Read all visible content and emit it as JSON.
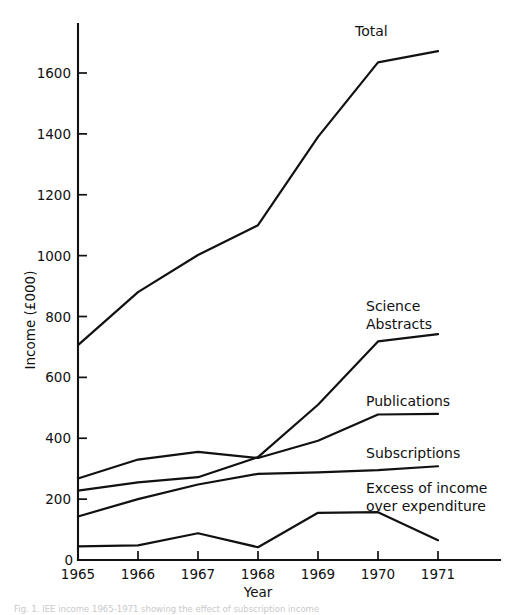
{
  "figure": {
    "caption": "Fig. 1. IEE income 1965-1971 showing the effect of subscription income"
  },
  "chart_data": {
    "type": "line",
    "title": "",
    "xlabel": "Year",
    "ylabel": "Income (£000)",
    "categories": [
      "1965",
      "1966",
      "1967",
      "1968",
      "1969",
      "1970",
      "1971"
    ],
    "x": [
      1965,
      1966,
      1967,
      1968,
      1969,
      1970,
      1971
    ],
    "xlim": [
      1965,
      1971
    ],
    "ylim": [
      0,
      1750
    ],
    "yticks": [
      0,
      200,
      400,
      600,
      800,
      1000,
      1200,
      1400,
      1600
    ],
    "ytick_labels": [
      "0",
      "200",
      "400",
      "600",
      "800",
      "1000",
      "1200",
      "1400",
      "1600"
    ],
    "grid": false,
    "legend": "inline-labels-right",
    "series": [
      {
        "name": "Total",
        "label": "Total",
        "values": [
          706,
          880,
          1002,
          1100,
          1390,
          1635,
          1672
        ]
      },
      {
        "name": "Science Abstracts",
        "label": "Science Abstracts",
        "values": [
          228,
          255,
          272,
          338,
          510,
          718,
          742
        ]
      },
      {
        "name": "Publications",
        "label": "Publications",
        "values": [
          268,
          330,
          355,
          335,
          392,
          478,
          480
        ]
      },
      {
        "name": "Subscriptions",
        "label": "Subscriptions",
        "values": [
          143,
          200,
          248,
          283,
          288,
          295,
          308
        ]
      },
      {
        "name": "Excess of income over expenditure",
        "label": "Excess of income over expenditure",
        "label_line1": "Excess of income",
        "label_line2": "over  expenditure",
        "values": [
          45,
          48,
          88,
          42,
          155,
          157,
          65
        ]
      }
    ]
  },
  "colors": {
    "ink": "#111111",
    "background": "#ffffff"
  }
}
